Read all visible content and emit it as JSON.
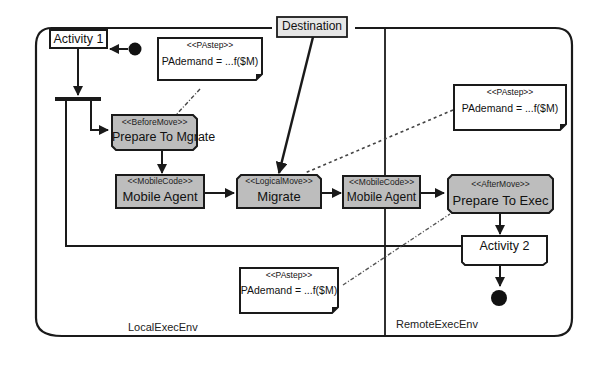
{
  "colors": {
    "line": "#1a1a1a",
    "action_fill": "#bdbdbd",
    "destination_fill": "#e6e6e6",
    "note_fill": "#ffffff",
    "background": "#ffffff"
  },
  "partitions": {
    "local": "LocalExecEnv",
    "remote": "RemoteExecEnv"
  },
  "object_node": {
    "label": "Destination"
  },
  "activities": {
    "activity1": "Activity 1",
    "activity2": "Activity 2"
  },
  "actions": {
    "prepare_migrate": {
      "stereotype": "<<BeforeMove>>",
      "name": "Prepare To Mgrate"
    },
    "mobile_agent_local": {
      "stereotype": "<<MobileCode>>",
      "name": "Mobile Agent"
    },
    "migrate": {
      "stereotype": "<<LogicalMove>>",
      "name": "Migrate"
    },
    "mobile_agent_remote": {
      "stereotype": "<<MobileCode>>",
      "name": "Mobile Agent"
    },
    "prepare_exec": {
      "stereotype": "<<AfterMove>>",
      "name": "Prepare To Exec"
    }
  },
  "notes": [
    {
      "stereotype": "<<PAstep>>",
      "value": "PAdemand = ...f($M)"
    },
    {
      "stereotype": "<<PAstep>>",
      "value": "PAdemand = ...f($M)"
    },
    {
      "stereotype": "<<PAstep>>",
      "value": "PAdemand = ...f($M)"
    }
  ]
}
